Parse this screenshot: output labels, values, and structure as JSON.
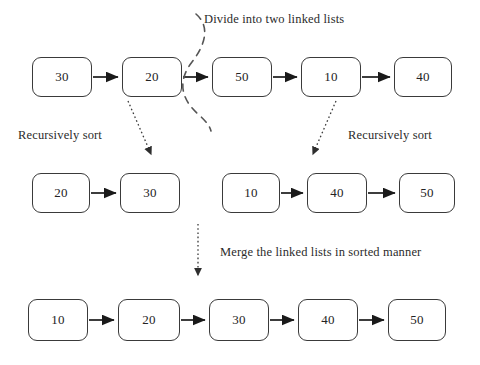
{
  "diagram": {
    "colors": {
      "background": "#ffffff",
      "node_border": "#3a3a3a",
      "node_fill": "#ffffff",
      "text": "#232323",
      "arrow_solid": "#1a1a1a",
      "arrow_dotted": "#444444",
      "divider_dash": "#555555"
    },
    "captions": {
      "divide": "Divide into two linked lists",
      "recursively_sort_left": "Recursively sort",
      "recursively_sort_right": "Recursively sort",
      "merge": "Merge the linked lists in sorted manner"
    },
    "rows": [
      {
        "name": "original-list",
        "nodes": [
          {
            "value": "30",
            "x": 32,
            "y": 57,
            "w": 60,
            "h": 40
          },
          {
            "value": "20",
            "x": 122,
            "y": 57,
            "w": 60,
            "h": 40
          },
          {
            "value": "50",
            "x": 212,
            "y": 57,
            "w": 60,
            "h": 40
          },
          {
            "value": "10",
            "x": 301,
            "y": 57,
            "w": 60,
            "h": 40
          },
          {
            "value": "40",
            "x": 394,
            "y": 57,
            "w": 58,
            "h": 40
          }
        ]
      },
      {
        "name": "left-sublist-sorted",
        "nodes": [
          {
            "value": "20",
            "x": 32,
            "y": 173,
            "w": 58,
            "h": 40
          },
          {
            "value": "30",
            "x": 120,
            "y": 173,
            "w": 60,
            "h": 40
          }
        ]
      },
      {
        "name": "right-sublist-sorted",
        "nodes": [
          {
            "value": "10",
            "x": 222,
            "y": 173,
            "w": 58,
            "h": 40
          },
          {
            "value": "40",
            "x": 307,
            "y": 173,
            "w": 60,
            "h": 40
          },
          {
            "value": "50",
            "x": 399,
            "y": 173,
            "w": 56,
            "h": 40
          }
        ]
      },
      {
        "name": "merged-list",
        "nodes": [
          {
            "value": "10",
            "x": 28,
            "y": 299,
            "w": 60,
            "h": 42
          },
          {
            "value": "20",
            "x": 118,
            "y": 299,
            "w": 62,
            "h": 42
          },
          {
            "value": "30",
            "x": 209,
            "y": 299,
            "w": 60,
            "h": 42
          },
          {
            "value": "40",
            "x": 298,
            "y": 299,
            "w": 60,
            "h": 42
          },
          {
            "value": "50",
            "x": 388,
            "y": 299,
            "w": 58,
            "h": 42
          }
        ]
      }
    ]
  }
}
